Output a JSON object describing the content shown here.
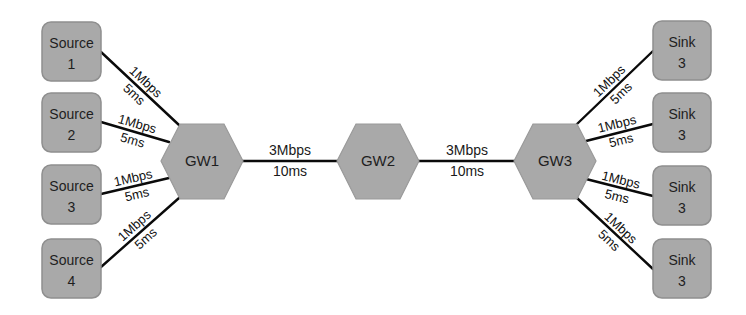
{
  "diagram": {
    "colors": {
      "node_fill": "#a9a9a9",
      "link": "#0a0a0a",
      "text": "#1e1e1e",
      "background": "#ffffff"
    },
    "sources": [
      {
        "line1": "Source",
        "line2": "1"
      },
      {
        "line1": "Source",
        "line2": "2"
      },
      {
        "line1": "Source",
        "line2": "3"
      },
      {
        "line1": "Source",
        "line2": "4"
      }
    ],
    "sinks": [
      {
        "line1": "Sink",
        "line2": "3"
      },
      {
        "line1": "Sink",
        "line2": "3"
      },
      {
        "line1": "Sink",
        "line2": "3"
      },
      {
        "line1": "Sink",
        "line2": "3"
      }
    ],
    "gateways": [
      {
        "label": "GW1"
      },
      {
        "label": "GW2"
      },
      {
        "label": "GW3"
      }
    ],
    "access_links": {
      "left": [
        {
          "bandwidth": "1Mbps",
          "delay": "5ms"
        },
        {
          "bandwidth": "1Mbps",
          "delay": "5ms"
        },
        {
          "bandwidth": "1Mbps",
          "delay": "5ms"
        },
        {
          "bandwidth": "1Mbps",
          "delay": "5ms"
        }
      ],
      "right": [
        {
          "bandwidth": "1Mbps",
          "delay": "5ms"
        },
        {
          "bandwidth": "1Mbps",
          "delay": "5ms"
        },
        {
          "bandwidth": "1Mbps",
          "delay": "5ms"
        },
        {
          "bandwidth": "1Mbps",
          "delay": "5ms"
        }
      ]
    },
    "trunk_links": [
      {
        "from": "GW1",
        "to": "GW2",
        "bandwidth": "3Mbps",
        "delay": "10ms"
      },
      {
        "from": "GW2",
        "to": "GW3",
        "bandwidth": "3Mbps",
        "delay": "10ms"
      }
    ]
  }
}
